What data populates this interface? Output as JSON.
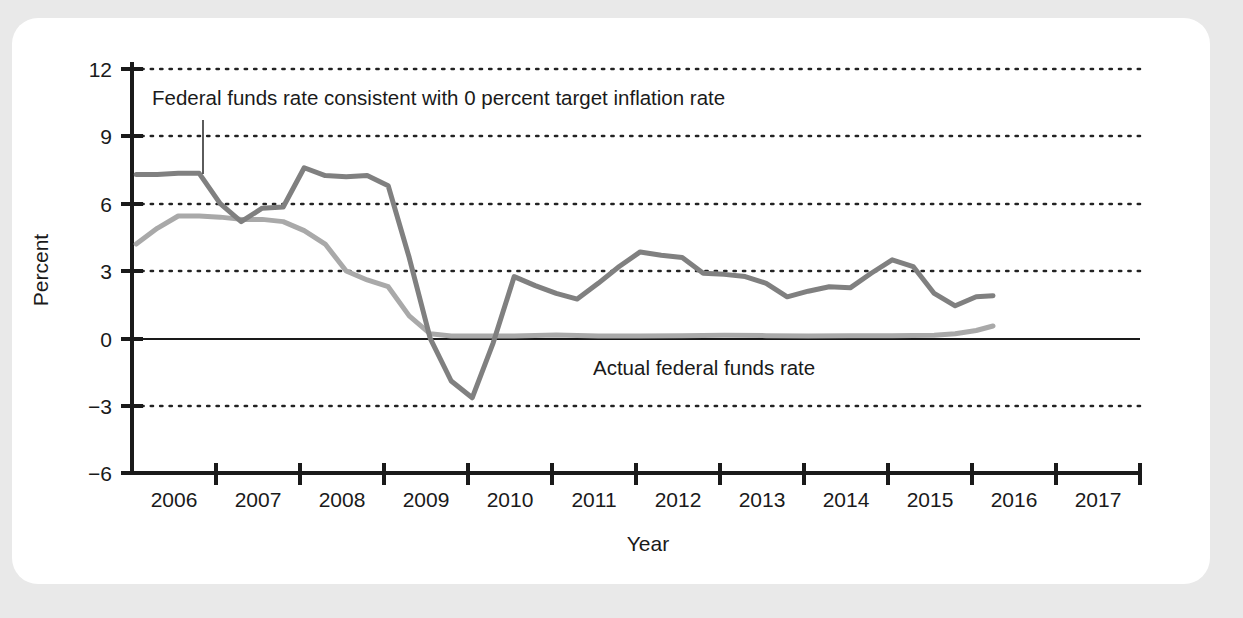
{
  "figure": {
    "background_color": "#e9e9e9",
    "card_color": "#ffffff"
  },
  "chart_data": {
    "type": "line",
    "title": "",
    "xlabel": "Year",
    "ylabel": "Percent",
    "xlim": [
      2005.5,
      2017.5
    ],
    "ylim": [
      -6,
      12
    ],
    "yticks": [
      -6,
      -3,
      0,
      3,
      6,
      9,
      12
    ],
    "ytick_labels": [
      "−6",
      "−3",
      "0",
      "3",
      "6",
      "9",
      "12"
    ],
    "xticks": [
      2005.5,
      2006.5,
      2007.5,
      2008.5,
      2009.5,
      2010.5,
      2011.5,
      2012.5,
      2013.5,
      2014.5,
      2015.5,
      2016.5,
      2017.5
    ],
    "xtick_labels": [
      "2006",
      "2007",
      "2008",
      "2009",
      "2010",
      "2011",
      "2012",
      "2013",
      "2014",
      "2015",
      "2016",
      "2017"
    ],
    "grid": "horizontal-dotted",
    "zero_line": true,
    "legend_position": "inline-annotations",
    "colors": {
      "consistent_rate": "#808080",
      "actual_rate": "#a9a9a9",
      "axis": "#1a1a1a",
      "gridline": "#222222"
    },
    "annotations": [
      {
        "name": "consistent-rate-annotation",
        "text": "Federal funds rate consistent with 0 percent target inflation rate",
        "x": 2006.0,
        "y": 10.3,
        "leader_line_to_y": 7.35
      },
      {
        "name": "actual-rate-annotation",
        "text": "Actual federal funds rate",
        "x": 2011.8,
        "y": -1.55
      }
    ],
    "series": [
      {
        "name": "Federal funds rate consistent with 0 percent target inflation rate",
        "key": "consistent_rate",
        "color": "#808080",
        "linewidth": 5,
        "x": [
          2005.55,
          2005.8,
          2006.05,
          2006.3,
          2006.55,
          2006.8,
          2007.05,
          2007.3,
          2007.55,
          2007.8,
          2008.05,
          2008.3,
          2008.55,
          2008.8,
          2009.05,
          2009.3,
          2009.55,
          2009.8,
          2010.05,
          2010.3,
          2010.55,
          2010.8,
          2011.05,
          2011.3,
          2011.55,
          2011.8,
          2012.05,
          2012.3,
          2012.55,
          2012.8,
          2013.05,
          2013.3,
          2013.55,
          2013.8,
          2014.05,
          2014.3,
          2014.55,
          2014.8,
          2015.05,
          2015.3,
          2015.55,
          2015.75
        ],
        "y": [
          7.3,
          7.3,
          7.35,
          7.35,
          6.0,
          5.2,
          5.8,
          5.85,
          7.6,
          7.25,
          7.2,
          7.25,
          6.8,
          3.6,
          0.0,
          -1.9,
          -2.65,
          -0.2,
          2.75,
          2.35,
          2.0,
          1.75,
          2.45,
          3.2,
          3.85,
          3.7,
          3.6,
          2.9,
          2.85,
          2.75,
          2.45,
          1.85,
          2.1,
          2.3,
          2.25,
          2.9,
          3.5,
          3.2,
          2.0,
          1.45,
          1.85,
          1.9
        ]
      },
      {
        "name": "Actual federal funds rate",
        "key": "actual_rate",
        "color": "#a9a9a9",
        "linewidth": 5,
        "x": [
          2005.55,
          2005.8,
          2006.05,
          2006.3,
          2006.55,
          2006.8,
          2007.05,
          2007.3,
          2007.55,
          2007.8,
          2008.05,
          2008.3,
          2008.55,
          2008.8,
          2009.05,
          2009.3,
          2009.55,
          2010.05,
          2010.55,
          2011.05,
          2011.55,
          2012.05,
          2012.55,
          2013.05,
          2013.55,
          2014.05,
          2014.55,
          2015.05,
          2015.3,
          2015.55,
          2015.75
        ],
        "y": [
          4.2,
          4.9,
          5.45,
          5.45,
          5.4,
          5.3,
          5.3,
          5.2,
          4.8,
          4.2,
          3.0,
          2.6,
          2.3,
          1.0,
          0.2,
          0.1,
          0.1,
          0.1,
          0.15,
          0.1,
          0.1,
          0.12,
          0.14,
          0.12,
          0.1,
          0.12,
          0.12,
          0.14,
          0.2,
          0.35,
          0.55
        ]
      }
    ]
  }
}
